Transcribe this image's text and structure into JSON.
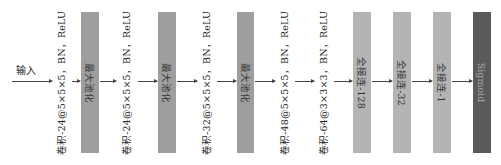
{
  "diagram": {
    "input_label": "输入",
    "colors": {
      "pool": "#9e9e9e",
      "fc": "#b4b4b4",
      "sigmoid": "#5a5a5a",
      "arrow": "#444444"
    },
    "layers": [
      {
        "type": "conv",
        "label": "卷积-24@5×5×5，BN，ReLU"
      },
      {
        "type": "pool",
        "label": "最大池化"
      },
      {
        "type": "conv",
        "label": "卷积-24@5×5×5，BN，ReLU"
      },
      {
        "type": "pool",
        "label": "最大池化"
      },
      {
        "type": "conv",
        "label": "卷积-32@5×5×5，BN，ReLU"
      },
      {
        "type": "pool",
        "label": "最大池化"
      },
      {
        "type": "conv",
        "label": "卷积-48@5×5×5，BN，ReLU"
      },
      {
        "type": "conv",
        "label": "卷积-64@3×3×3，BN，ReLU"
      },
      {
        "type": "fc",
        "label": "全接连-128"
      },
      {
        "type": "fc",
        "label": "全接连-32"
      },
      {
        "type": "fc",
        "label": "全接连-1"
      },
      {
        "type": "sigmoid",
        "label": "Sigmoid"
      }
    ]
  }
}
